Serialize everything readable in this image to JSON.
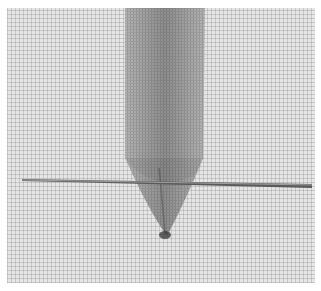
{
  "image": {
    "description": "Close-up photograph of a woven ribbon passing through an even-weave linen fabric, with a long embroidery needle lying horizontally across it",
    "colors": {
      "fabric": "#e6e6e6",
      "weave": "#8c8c8c",
      "ribbon": "#b4b4b4",
      "ribbon_shadow": "#6e6e6e",
      "needle": "#5a5a5a",
      "needle_highlight": "#d0d0d0"
    }
  }
}
